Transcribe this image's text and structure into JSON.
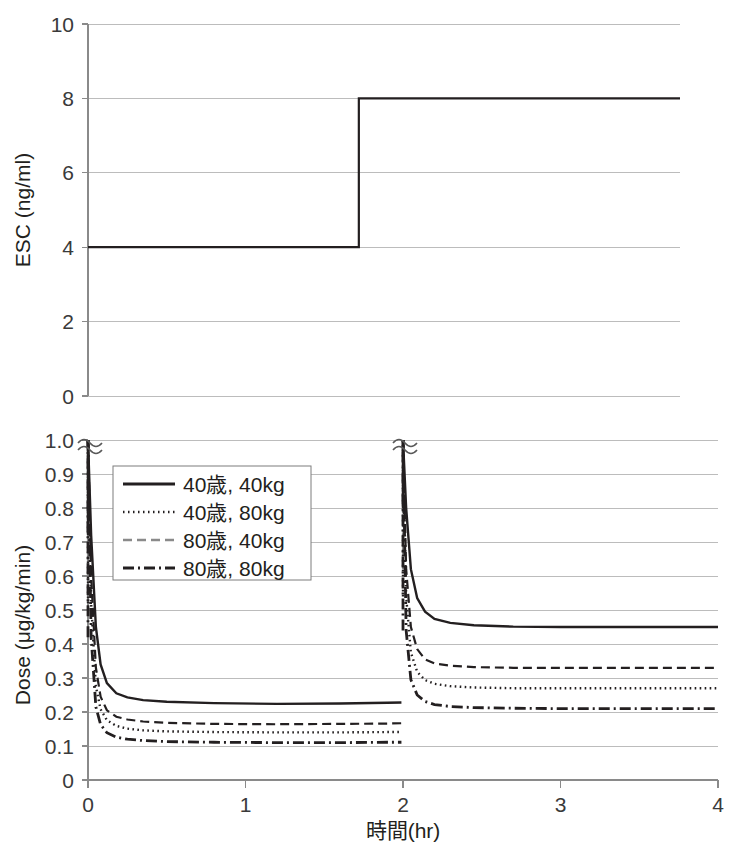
{
  "chart_data": [
    {
      "id": "esc-panel",
      "type": "line",
      "title": "",
      "xlabel": "",
      "ylabel": "ESC (ng/ml)",
      "xlim": [
        0,
        4
      ],
      "ylim": [
        0,
        10
      ],
      "xticks": [
        0,
        1,
        2,
        3,
        4
      ],
      "xticklabels": [
        "",
        "",
        "",
        "",
        ""
      ],
      "yticks": [
        0,
        2,
        4,
        6,
        8,
        10
      ],
      "yticklabels": [
        "0",
        "2",
        "4",
        "6",
        "8",
        "10"
      ],
      "grid": true,
      "legend": "none",
      "series": [
        {
          "name": "Effect-site target concentration",
          "style": "solid",
          "step": true,
          "x": [
            0,
            1.83,
            1.83,
            4
          ],
          "y": [
            4,
            4,
            8,
            8
          ]
        }
      ],
      "annotations": [
        {
          "text": "step increase from 4 to 8 ng/ml at t = 1.83 hr"
        }
      ]
    },
    {
      "id": "dose-panel",
      "type": "line",
      "title": "",
      "xlabel": "時間(hr)",
      "ylabel": "Dose (μg/kg/min)",
      "xlim": [
        0,
        4
      ],
      "ylim": [
        0,
        1.0
      ],
      "xticks": [
        0,
        1,
        2,
        3,
        4
      ],
      "xticklabels": [
        "0",
        "1",
        "2",
        "3",
        "4"
      ],
      "yticks": [
        0,
        0.1,
        0.2,
        0.3,
        0.4,
        0.5,
        0.6,
        0.7,
        0.8,
        0.9,
        1.0
      ],
      "yticklabels": [
        "0",
        "0.1",
        "0.2",
        "0.3",
        "0.4",
        "0.5",
        "0.6",
        "0.7",
        "0.8",
        "0.9",
        "1.0"
      ],
      "grid": true,
      "axis_break": {
        "present": true,
        "positions": [
          "y-axis top at 1.0",
          "vertical spike at t = 2.0"
        ],
        "glyph": "squiggle"
      },
      "legend": {
        "position": "upper-left-inset",
        "entries": [
          {
            "label": "40歳, 40kg",
            "style": "solid"
          },
          {
            "label": "40歳, 80kg",
            "style": "dotted"
          },
          {
            "label": "80歳, 40kg",
            "style": "dashed"
          },
          {
            "label": "80歳, 80kg",
            "style": "dash-dot"
          }
        ]
      },
      "series": [
        {
          "name": "40歳, 40kg",
          "style": "solid",
          "bolus_spike_times": [
            0.0,
            2.0
          ],
          "plateau_before_2hr": 0.225,
          "plateau_after_2hr": 0.45,
          "x": [
            0,
            0.02,
            0.05,
            0.08,
            0.12,
            0.18,
            0.25,
            0.35,
            0.5,
            0.8,
            1.2,
            1.6,
            1.9,
            1.99,
            2.0,
            2.02,
            2.05,
            2.09,
            2.14,
            2.2,
            2.3,
            2.45,
            2.7,
            3.0,
            3.5,
            4.0
          ],
          "y": [
            1.0,
            0.72,
            0.45,
            0.34,
            0.285,
            0.255,
            0.243,
            0.235,
            0.23,
            0.226,
            0.224,
            0.225,
            0.227,
            0.228,
            1.0,
            0.8,
            0.62,
            0.535,
            0.495,
            0.474,
            0.462,
            0.455,
            0.451,
            0.45,
            0.45,
            0.45
          ]
        },
        {
          "name": "80歳, 40kg",
          "style": "dashed",
          "bolus_spike_times": [
            0.0,
            2.0
          ],
          "plateau_before_2hr": 0.165,
          "plateau_after_2hr": 0.33,
          "x": [
            0,
            0.02,
            0.05,
            0.08,
            0.12,
            0.18,
            0.25,
            0.35,
            0.5,
            0.8,
            1.2,
            1.6,
            1.9,
            1.99,
            2.0,
            2.02,
            2.05,
            2.09,
            2.14,
            2.2,
            2.3,
            2.45,
            2.7,
            3.0,
            3.5,
            4.0
          ],
          "y": [
            1.0,
            0.6,
            0.33,
            0.245,
            0.205,
            0.186,
            0.178,
            0.172,
            0.168,
            0.165,
            0.164,
            0.165,
            0.166,
            0.167,
            1.0,
            0.62,
            0.45,
            0.385,
            0.355,
            0.343,
            0.336,
            0.332,
            0.33,
            0.33,
            0.33,
            0.33
          ]
        },
        {
          "name": "40歳, 80kg",
          "style": "dotted",
          "bolus_spike_times": [
            0.0,
            2.0
          ],
          "plateau_before_2hr": 0.14,
          "plateau_after_2hr": 0.27,
          "x": [
            0,
            0.02,
            0.05,
            0.08,
            0.12,
            0.18,
            0.25,
            0.35,
            0.5,
            0.8,
            1.2,
            1.6,
            1.9,
            1.99,
            2.0,
            2.02,
            2.05,
            2.09,
            2.14,
            2.2,
            2.3,
            2.45,
            2.7,
            3.0,
            3.5,
            4.0
          ],
          "y": [
            1.0,
            0.52,
            0.275,
            0.208,
            0.176,
            0.159,
            0.151,
            0.146,
            0.143,
            0.141,
            0.14,
            0.14,
            0.141,
            0.141,
            1.0,
            0.54,
            0.375,
            0.318,
            0.294,
            0.283,
            0.276,
            0.272,
            0.27,
            0.27,
            0.27,
            0.27
          ]
        },
        {
          "name": "80歳, 80kg",
          "style": "dash-dot",
          "bolus_spike_times": [
            0.0,
            2.0
          ],
          "plateau_before_2hr": 0.11,
          "plateau_after_2hr": 0.21,
          "x": [
            0,
            0.02,
            0.05,
            0.08,
            0.12,
            0.18,
            0.25,
            0.35,
            0.5,
            0.8,
            1.2,
            1.6,
            1.9,
            1.99,
            2.0,
            2.02,
            2.05,
            2.09,
            2.14,
            2.2,
            2.3,
            2.45,
            2.7,
            3.0,
            3.5,
            4.0
          ],
          "y": [
            1.0,
            0.42,
            0.215,
            0.163,
            0.139,
            0.126,
            0.12,
            0.116,
            0.113,
            0.111,
            0.11,
            0.11,
            0.111,
            0.111,
            1.0,
            0.44,
            0.295,
            0.25,
            0.231,
            0.222,
            0.216,
            0.213,
            0.211,
            0.21,
            0.21,
            0.21
          ]
        }
      ]
    }
  ],
  "panels": {
    "top": {
      "ylabel": "ESC (ng/ml)",
      "yticklabels": [
        "10",
        "8",
        "6",
        "4",
        "2",
        "0"
      ]
    },
    "bottom": {
      "ylabel": "Dose (μg/kg/min)",
      "yticklabels": [
        "1.0",
        "0.9",
        "0.8",
        "0.7",
        "0.6",
        "0.5",
        "0.4",
        "0.3",
        "0.2",
        "0.1",
        "0"
      ],
      "xticklabels": [
        "0",
        "1",
        "2",
        "3",
        "4"
      ],
      "xlabel": "時間(hr)",
      "origin_label": "0",
      "legend": [
        "40歳, 40kg",
        "40歳, 80kg",
        "80歳, 40kg",
        "80歳, 80kg"
      ]
    }
  },
  "colors": {
    "background": "#ffffff",
    "ink": "#231f20",
    "gridline": "#bcbcbc",
    "axis": "#8a8a8a"
  }
}
